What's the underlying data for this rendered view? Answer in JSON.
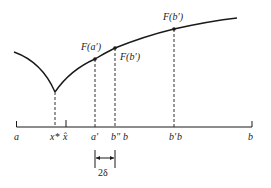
{
  "diagram": {
    "type": "function-search-interval",
    "curve_labels": {
      "fa_prime": "F(a′)",
      "fb_double_prime": "F(b′)",
      "fb_prime": "F(b′)"
    },
    "axis_labels": {
      "a": "a",
      "x_star": "x*",
      "x_hat": "x̂",
      "a_prime": "a′",
      "b_double_prime": "b″",
      "b": "b",
      "b_prime": "b′",
      "beta": "b",
      "b_end": "b"
    },
    "interval_label": "2δ",
    "colors": {
      "ink": "#1a1a1a",
      "background": "#ffffff"
    }
  }
}
